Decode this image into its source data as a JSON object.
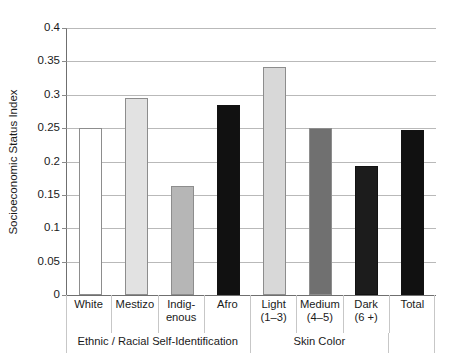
{
  "chart_data": {
    "type": "bar",
    "title": "",
    "xlabel": "",
    "ylabel": "Socioeconomic Status Index",
    "ylim": [
      0,
      0.4
    ],
    "yticks": [
      "0",
      "0.05",
      "0.1",
      "0.15",
      "0.2",
      "0.25",
      "0.3",
      "0.35",
      "0.4"
    ],
    "ytick_values": [
      0,
      0.05,
      0.1,
      0.15,
      0.2,
      0.25,
      0.3,
      0.35,
      0.4
    ],
    "grid": true,
    "legend": "none",
    "categories": [
      "White",
      "Mestizo",
      "Indig-\nenous",
      "Afro",
      "Light\n(1–3)",
      "Medium\n(4–5)",
      "Dark\n(6 +)",
      "Total"
    ],
    "values": [
      0.25,
      0.295,
      0.163,
      0.285,
      0.342,
      0.25,
      0.193,
      0.247
    ],
    "bar_colors": [
      "#ffffff",
      "#e2e2e2",
      "#b6b6b6",
      "#111111",
      "#d8d8d8",
      "#707070",
      "#1c1c1c",
      "#111111"
    ],
    "bars": [
      {
        "label_line1": "White",
        "label_line2": "",
        "value": 0.25,
        "color": "#ffffff",
        "group": "Ethnic / Racial Self-Identification"
      },
      {
        "label_line1": "Mestizo",
        "label_line2": "",
        "value": 0.295,
        "color": "#e2e2e2",
        "group": "Ethnic / Racial Self-Identification"
      },
      {
        "label_line1": "Indig-",
        "label_line2": "enous",
        "value": 0.163,
        "color": "#b6b6b6",
        "group": "Ethnic / Racial Self-Identification"
      },
      {
        "label_line1": "Afro",
        "label_line2": "",
        "value": 0.285,
        "color": "#111111",
        "group": "Ethnic / Racial Self-Identification"
      },
      {
        "label_line1": "Light",
        "label_line2": "(1–3)",
        "value": 0.342,
        "color": "#d8d8d8",
        "group": "Skin Color"
      },
      {
        "label_line1": "Medium",
        "label_line2": "(4–5)",
        "value": 0.25,
        "color": "#707070",
        "group": "Skin Color"
      },
      {
        "label_line1": "Dark",
        "label_line2": "(6 +)",
        "value": 0.193,
        "color": "#1c1c1c",
        "group": "Skin Color"
      },
      {
        "label_line1": "Total",
        "label_line2": "",
        "value": 0.247,
        "color": "#111111",
        "group": ""
      }
    ],
    "groups": [
      {
        "label": "Ethnic / Racial Self-Identification",
        "span": 4
      },
      {
        "label": "Skin Color",
        "span": 3
      },
      {
        "label": "",
        "span": 1
      }
    ]
  },
  "axis": {
    "y_title": "Socioeconomic Status Index"
  },
  "caption": {
    "text": ""
  },
  "colors": {
    "gridline": "#b9b9b9",
    "axis": "#6f6f6f",
    "text": "#1a1a1a"
  }
}
